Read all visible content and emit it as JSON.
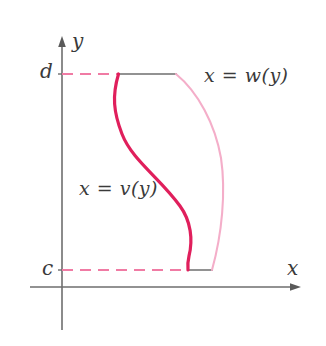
{
  "figure": {
    "background": "#ffffff",
    "width": 326,
    "height": 346
  },
  "axes": {
    "y_axis_label": "y",
    "x_axis_label": "x",
    "axis_color": "#6e6e6e",
    "origin": {
      "x": 62,
      "y": 287
    },
    "y_axis": {
      "x": 62,
      "top": 37,
      "bottom": 330,
      "arrow": "up"
    },
    "x_axis": {
      "y": 287,
      "left": 30,
      "right": 300,
      "arrow": "right"
    }
  },
  "ticks": [
    {
      "name": "d",
      "label": "d",
      "axis": "y",
      "pixel_y": 74
    },
    {
      "name": "c",
      "label": "c",
      "axis": "y",
      "pixel_y": 270
    }
  ],
  "curves": [
    {
      "name": "v-curve",
      "label": "x = v(y)",
      "color": "#e01f5c",
      "stroke_width": 3.2,
      "description": "left boundary, S-shaped curve from (118,74) to (188,270)",
      "path": "M 118.5 74 C 112 96 113.5 112 122 134 C 132 160 160 178 180 206 C 191 221 193 240 189 256 C 187.5 262 187.5 266 188 270"
    },
    {
      "name": "w-curve",
      "label": "x = w(y)",
      "color": "#f4aec9",
      "stroke_width": 2.1,
      "description": "right boundary, outward bulging arc from (176,74) to (212,270)",
      "path": "M 176 74 C 198 92 215 124 221 158 C 226 192 222 234 212 270"
    }
  ],
  "connectors": [
    {
      "name": "top-dashed-guide",
      "color": "#f07ba4",
      "style": "dashed",
      "y": 74,
      "x_start": 62,
      "x_end": 118
    },
    {
      "name": "top-solid-chord",
      "color": "#6e6e6e",
      "style": "solid",
      "y": 74,
      "x_start": 118,
      "x_end": 176
    },
    {
      "name": "bottom-dashed-guide",
      "color": "#f07ba4",
      "style": "dashed",
      "y": 270,
      "x_start": 62,
      "x_end": 188
    },
    {
      "name": "bottom-solid-chord",
      "color": "#6e6e6e",
      "style": "solid",
      "y": 270,
      "x_start": 188,
      "x_end": 212
    }
  ],
  "labels": {
    "w_label": "x = w(y)",
    "v_label": "x = v(y)",
    "y_label": "y",
    "x_label": "x",
    "d_label": "d",
    "c_label": "c"
  },
  "colors": {
    "curve_primary": "#e01f5c",
    "curve_secondary": "#f4aec9",
    "dashed_guide": "#f07ba4",
    "axis": "#6e6e6e",
    "text": "#3a3a3a",
    "chord": "#6e6e6e"
  }
}
